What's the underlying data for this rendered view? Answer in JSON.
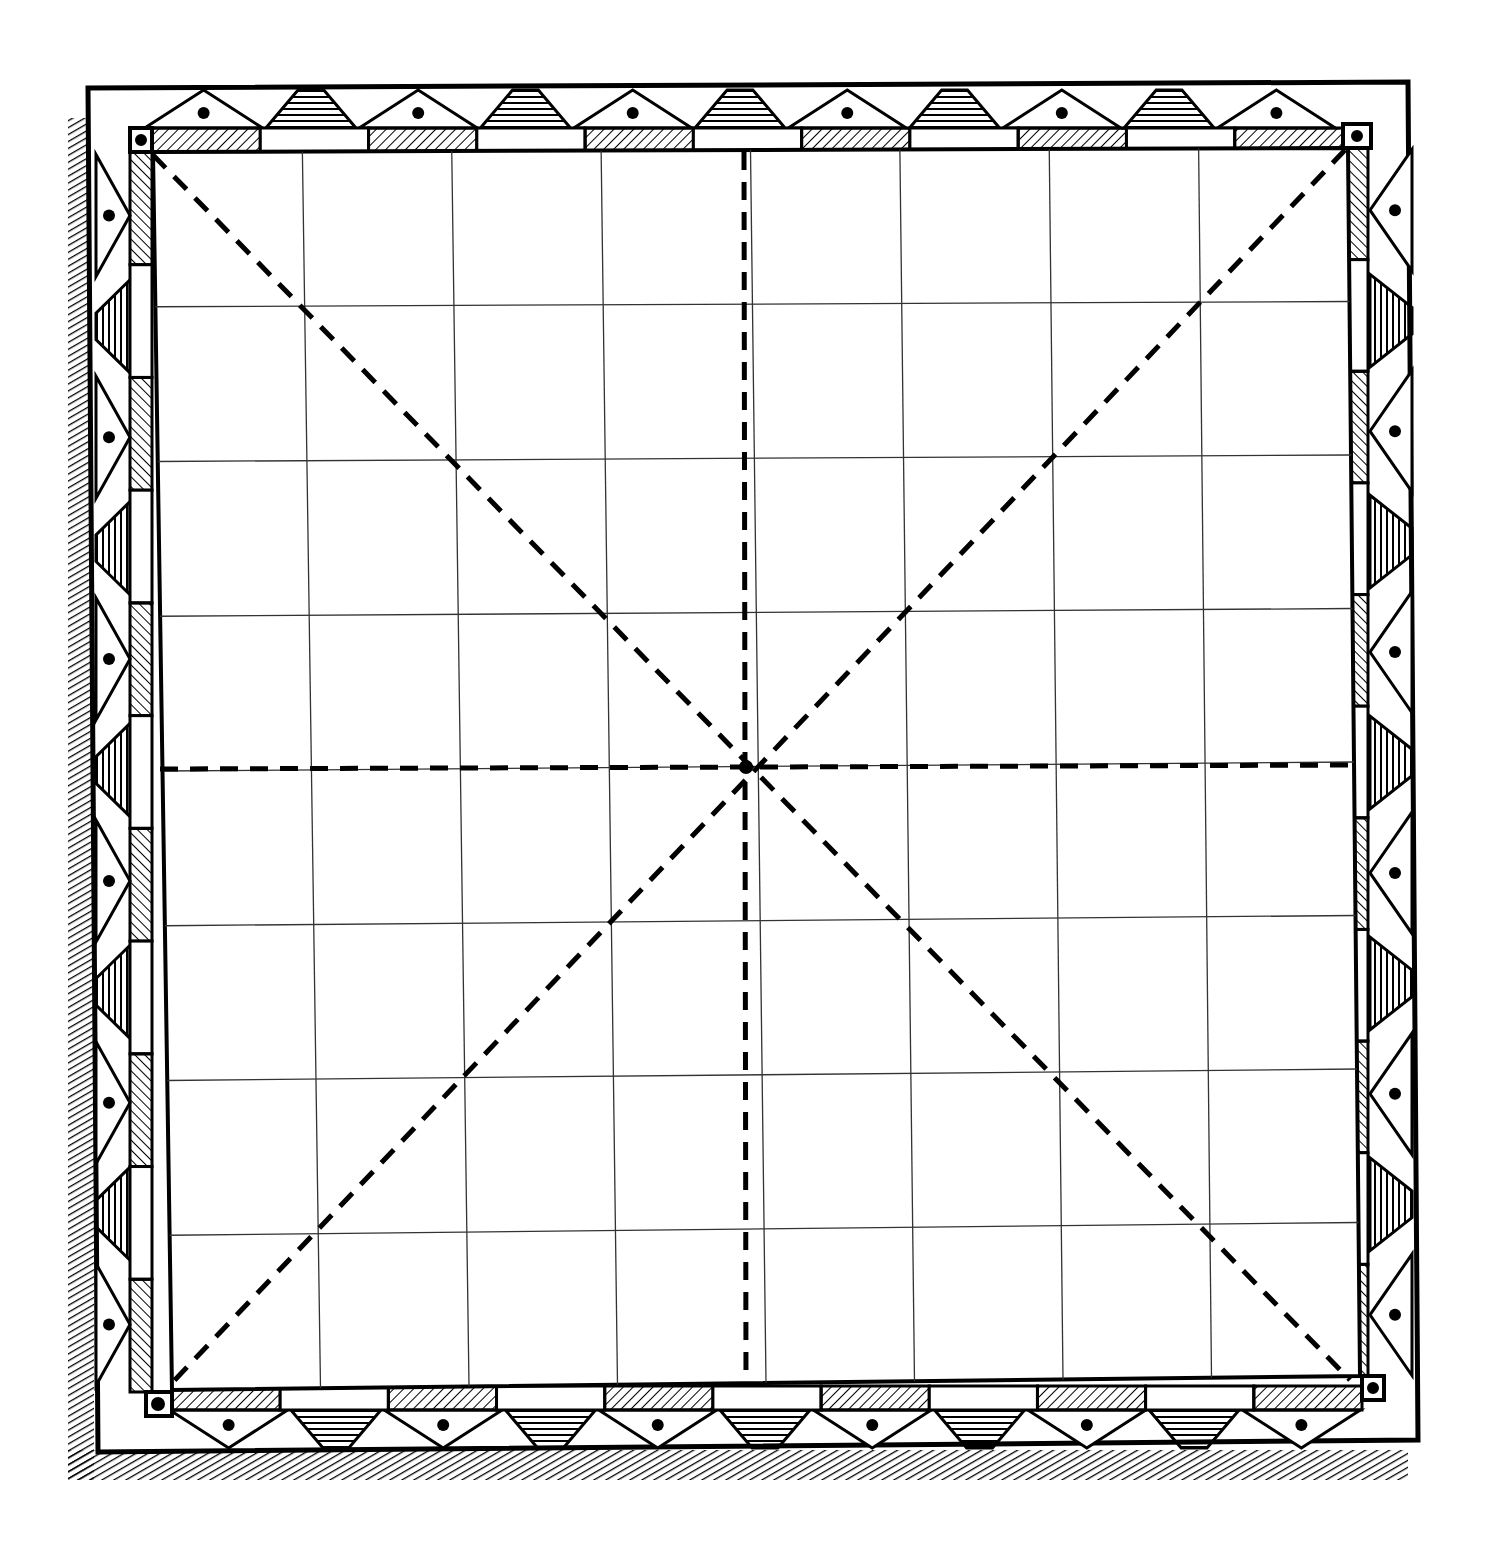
{
  "board": {
    "type": "square-grid game board",
    "rows": 8,
    "cols": 8,
    "line_color": "#000000",
    "background_color": "#ffffff",
    "grid_line_color": "#333333",
    "center_point": "intersection of diagonals and midlines",
    "dashed_lines": [
      "vertical-midline",
      "horizontal-midline",
      "diagonal-top-left-to-bottom-right",
      "diagonal-top-right-to-bottom-left"
    ],
    "border": {
      "style": "ornamental",
      "inner_strip_pattern": [
        "hatched",
        "plain"
      ],
      "outer_band_pattern": [
        "hatched-trapezoid",
        "dotted-triangle"
      ],
      "corner_squares": 4,
      "shadow": "cross-hatched shadow on left and bottom edges"
    }
  }
}
